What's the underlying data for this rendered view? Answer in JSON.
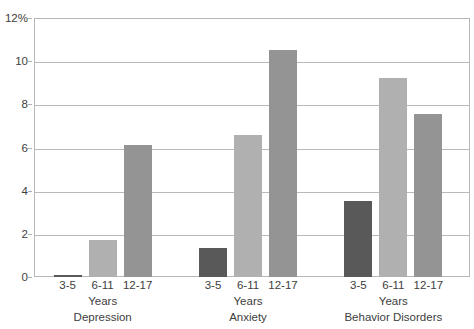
{
  "chart_data": {
    "type": "bar",
    "title": "",
    "xlabel": "Years",
    "ylabel": "",
    "ylim": [
      0,
      12
    ],
    "y_unit": "%",
    "grid": true,
    "legend": "none",
    "y_ticks": [
      "12%",
      "10",
      "8",
      "6",
      "4",
      "2",
      "0"
    ],
    "y_tick_values": [
      12,
      10,
      8,
      6,
      4,
      2,
      0
    ],
    "categories": [
      "3-5",
      "6-11",
      "12-17"
    ],
    "groups": [
      {
        "name": "Depression",
        "unit_label": "Years",
        "bars": [
          {
            "category": "3-5",
            "value": 0.1,
            "color": "#595959"
          },
          {
            "category": "6-11",
            "value": 1.7,
            "color": "#b0b0b0"
          },
          {
            "category": "12-17",
            "value": 6.1,
            "color": "#949494"
          }
        ]
      },
      {
        "name": "Anxiety",
        "unit_label": "Years",
        "bars": [
          {
            "category": "3-5",
            "value": 1.35,
            "color": "#595959"
          },
          {
            "category": "6-11",
            "value": 6.6,
            "color": "#b0b0b0"
          },
          {
            "category": "12-17",
            "value": 10.5,
            "color": "#949494"
          }
        ]
      },
      {
        "name": "Behavior Disorders",
        "unit_label": "Years",
        "bars": [
          {
            "category": "3-5",
            "value": 3.5,
            "color": "#595959"
          },
          {
            "category": "6-11",
            "value": 9.2,
            "color": "#b0b0b0"
          },
          {
            "category": "12-17",
            "value": 7.55,
            "color": "#949494"
          }
        ]
      }
    ]
  },
  "style": {
    "axis_color": "#b7b7b7",
    "grid_color": "#b9b9b9",
    "text_color": "#3d3d3d",
    "background": "#ffffff"
  }
}
